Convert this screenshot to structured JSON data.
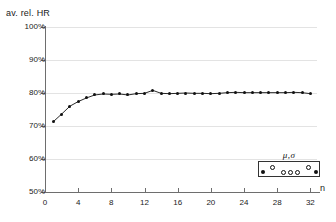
{
  "chart_data": {
    "type": "line",
    "title": "",
    "ylabel": "av. rel. HR",
    "xlabel": "n",
    "ylim": [
      50,
      100
    ],
    "xlim": [
      0,
      32.8
    ],
    "grid": true,
    "y_ticks": [
      "50%",
      "60%",
      "70%",
      "80%",
      "90%",
      "100%"
    ],
    "y_tick_values": [
      50,
      60,
      70,
      80,
      90,
      100
    ],
    "x_ticks": [
      "0",
      "4",
      "8",
      "12",
      "16",
      "20",
      "24",
      "28",
      "32"
    ],
    "x_tick_values": [
      0,
      4,
      8,
      12,
      16,
      20,
      24,
      28,
      32
    ],
    "series": [
      {
        "name": "av. rel. HR",
        "marker": "filled-circle",
        "color": "#111111",
        "x": [
          1,
          2,
          3,
          4,
          5,
          6,
          7,
          8,
          9,
          10,
          11,
          12,
          13,
          14,
          15,
          16,
          17,
          18,
          19,
          20,
          21,
          22,
          23,
          24,
          25,
          26,
          27,
          28,
          29,
          30,
          31,
          32
        ],
        "values": [
          71.3,
          73.6,
          76.0,
          77.4,
          78.5,
          79.4,
          79.7,
          79.6,
          79.7,
          79.4,
          79.8,
          79.9,
          80.8,
          79.9,
          79.8,
          79.9,
          80.0,
          79.9,
          79.9,
          79.8,
          79.9,
          80.1,
          80.2,
          80.1,
          80.1,
          80.1,
          80.1,
          80.1,
          80.1,
          80.2,
          80.1,
          79.8
        ]
      }
    ],
    "legend": {
      "position": "bottom-right",
      "title": "μ,σ",
      "markers": [
        {
          "shape": "filled-circle",
          "x": 4,
          "y": 10
        },
        {
          "shape": "open-circle",
          "x": 13,
          "y": 5
        },
        {
          "shape": "open-circle",
          "x": 24,
          "y": 10
        },
        {
          "shape": "open-circle",
          "x": 31,
          "y": 10
        },
        {
          "shape": "open-circle",
          "x": 38,
          "y": 10
        },
        {
          "shape": "open-circle",
          "x": 49,
          "y": 5
        },
        {
          "shape": "filled-circle",
          "x": 57,
          "y": 10
        }
      ]
    }
  }
}
